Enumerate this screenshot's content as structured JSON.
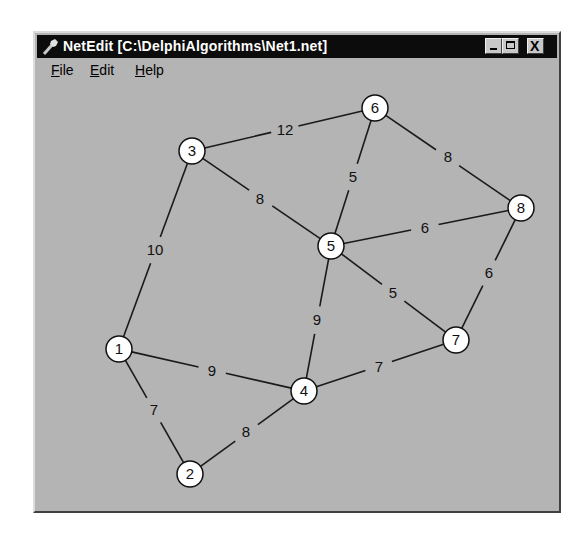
{
  "window": {
    "title": "NetEdit [C:\\DelphiAlgorithms\\Net1.net]",
    "icon": "wrench-icon",
    "buttons": {
      "minimize": "_",
      "maximize": "□",
      "close": "X"
    }
  },
  "menu": [
    {
      "label": "File",
      "mnemonic": "F",
      "rest": "ile"
    },
    {
      "label": "Edit",
      "mnemonic": "E",
      "rest": "dit"
    },
    {
      "label": "Help",
      "mnemonic": "H",
      "rest": "elp"
    }
  ],
  "colors": {
    "window_bg": "#b4b4b4",
    "titlebar_bg": "#0c0c0c",
    "node_fill": "#ffffff",
    "edge": "#1a1a1a"
  },
  "network": {
    "nodes": [
      {
        "id": "1",
        "x": 119,
        "y": 349
      },
      {
        "id": "2",
        "x": 190,
        "y": 474
      },
      {
        "id": "3",
        "x": 192,
        "y": 151
      },
      {
        "id": "4",
        "x": 304,
        "y": 391
      },
      {
        "id": "5",
        "x": 331,
        "y": 246
      },
      {
        "id": "6",
        "x": 375,
        "y": 108
      },
      {
        "id": "7",
        "x": 456,
        "y": 340
      },
      {
        "id": "8",
        "x": 521,
        "y": 208
      }
    ],
    "edges": [
      {
        "from": "3",
        "to": "6",
        "weight": "12",
        "lx": 285,
        "ly": 130
      },
      {
        "from": "3",
        "to": "5",
        "weight": "8",
        "lx": 260,
        "ly": 199
      },
      {
        "from": "3",
        "to": "1",
        "weight": "10",
        "lx": 155,
        "ly": 250
      },
      {
        "from": "6",
        "to": "5",
        "weight": "5",
        "lx": 353,
        "ly": 177
      },
      {
        "from": "6",
        "to": "8",
        "weight": "8",
        "lx": 448,
        "ly": 157
      },
      {
        "from": "5",
        "to": "8",
        "weight": "6",
        "lx": 425,
        "ly": 228
      },
      {
        "from": "5",
        "to": "7",
        "weight": "5",
        "lx": 393,
        "ly": 293
      },
      {
        "from": "5",
        "to": "4",
        "weight": "9",
        "lx": 317,
        "ly": 320
      },
      {
        "from": "8",
        "to": "7",
        "weight": "6",
        "lx": 489,
        "ly": 273
      },
      {
        "from": "1",
        "to": "4",
        "weight": "9",
        "lx": 212,
        "ly": 371
      },
      {
        "from": "1",
        "to": "2",
        "weight": "7",
        "lx": 154,
        "ly": 410
      },
      {
        "from": "2",
        "to": "4",
        "weight": "8",
        "lx": 246,
        "ly": 432
      },
      {
        "from": "4",
        "to": "7",
        "weight": "7",
        "lx": 379,
        "ly": 367
      }
    ],
    "node_radius": 13
  }
}
